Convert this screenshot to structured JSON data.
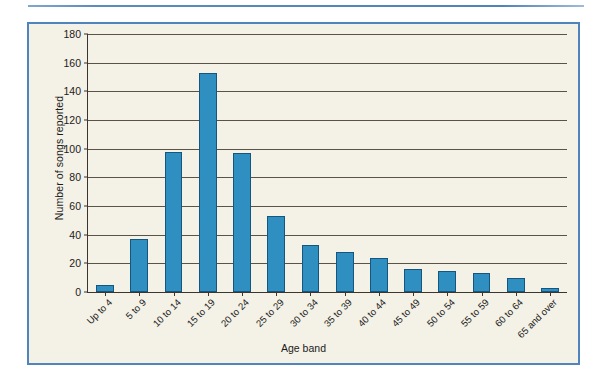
{
  "chart_data": {
    "type": "bar",
    "title": "",
    "xlabel": "Age band",
    "ylabel": "Number of songs reported",
    "categories": [
      "Up to 4",
      "5 to 9",
      "10 to 14",
      "15 to 19",
      "20 to 24",
      "25 to 29",
      "30 to 34",
      "35 to 39",
      "40 to 44",
      "45 to 49",
      "50 to 54",
      "55 to 59",
      "60 to 64",
      "65 and over"
    ],
    "values": [
      5,
      37,
      98,
      153,
      97,
      53,
      33,
      28,
      24,
      16,
      15,
      13,
      10,
      3
    ],
    "ylim": [
      0,
      180
    ],
    "yticks": [
      0,
      20,
      40,
      60,
      80,
      100,
      120,
      140,
      160,
      180
    ],
    "ytick_labels": [
      "0",
      "20",
      "40",
      "60",
      "80",
      "100",
      "120",
      "140",
      "160",
      "180"
    ],
    "grid": true,
    "legend": false,
    "bar_color": "#2e8fc0",
    "bar_edge_color": "#14567d",
    "plot_background": "#f4f1e6",
    "frame_color": "#4f84bc"
  }
}
